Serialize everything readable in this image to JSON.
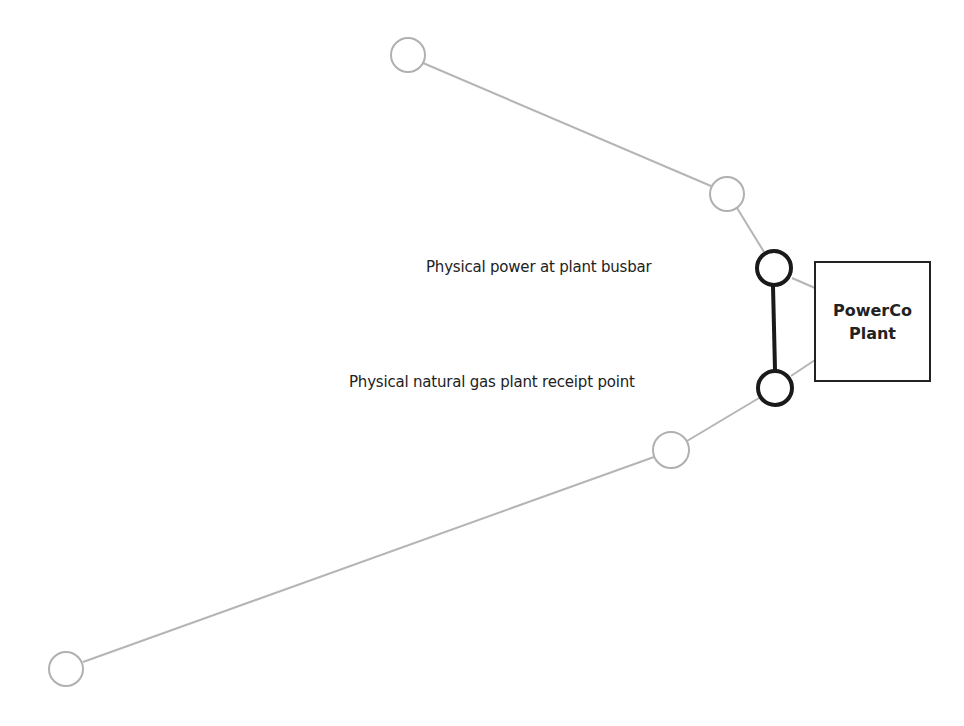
{
  "colors": {
    "gray_line": "#b5b5b5",
    "gray_node": "#b0b0b0",
    "dark": "#1a1a1a"
  },
  "labels": {
    "power_busbar": "Physical power at plant busbar",
    "gas_receipt": "Physical natural gas plant receipt point"
  },
  "plant": {
    "line1": "PowerCo",
    "line2": "Plant"
  },
  "nodes": [
    {
      "id": "power-upstream-far",
      "x": 408,
      "y": 55,
      "style": "gray"
    },
    {
      "id": "power-upstream-near",
      "x": 727,
      "y": 194,
      "style": "gray"
    },
    {
      "id": "power-busbar",
      "x": 774,
      "y": 268,
      "style": "dark"
    },
    {
      "id": "gas-receipt",
      "x": 775,
      "y": 388,
      "style": "dark"
    },
    {
      "id": "gas-upstream-near",
      "x": 671,
      "y": 450,
      "style": "gray"
    },
    {
      "id": "gas-upstream-far",
      "x": 66,
      "y": 669,
      "style": "gray"
    }
  ]
}
